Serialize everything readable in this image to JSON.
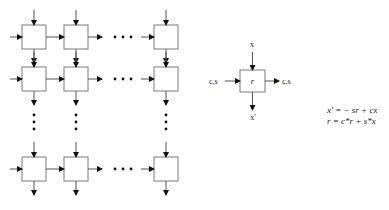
{
  "diagram": {
    "array": {
      "rows_drawn": 3,
      "cols_drawn": 3,
      "row_y": [
        25,
        67,
        157
      ],
      "col_x": [
        22,
        64,
        154
      ],
      "cell_size": 24,
      "ellipsis": "..."
    },
    "cell": {
      "label": "r",
      "input_top": "x",
      "output_bottom": "x'",
      "input_left": "c,s",
      "output_right": "c,s"
    },
    "equations": {
      "line1": "x' = − sr + cx",
      "line2": "r = c*r + s*x"
    },
    "colors": {
      "box_stroke": "#7a7a7a",
      "line": "#555555",
      "text": "#222222",
      "background": "#ffffff"
    }
  }
}
